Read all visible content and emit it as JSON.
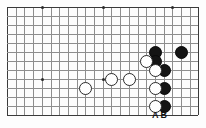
{
  "diagram": {
    "kind": "go-board-diagram",
    "board": {
      "columns": 23,
      "rows": 13,
      "origin_x": 7,
      "origin_y": 7,
      "step_x": 8.7,
      "step_y": 9.0,
      "line_color": "#8e8e8e",
      "edge_color": "#3a3a3a",
      "background": "#fdfdfd"
    },
    "hoshi": [
      {
        "col": 4,
        "row": 0
      },
      {
        "col": 11,
        "row": 0
      },
      {
        "col": 19,
        "row": 0
      },
      {
        "col": 4,
        "row": 8
      },
      {
        "col": 11,
        "row": 8
      }
    ],
    "stones": [
      {
        "color": "black",
        "col": 17,
        "row": 5
      },
      {
        "color": "black",
        "col": 20,
        "row": 5
      },
      {
        "color": "black",
        "col": 17,
        "row": 6
      },
      {
        "color": "black",
        "col": 18,
        "row": 7
      },
      {
        "color": "black",
        "col": 18,
        "row": 9
      },
      {
        "color": "black",
        "col": 18,
        "row": 11
      },
      {
        "color": "white",
        "col": 16,
        "row": 6
      },
      {
        "color": "white",
        "col": 17,
        "row": 7
      },
      {
        "color": "white",
        "col": 17,
        "row": 9
      },
      {
        "color": "white",
        "col": 17,
        "row": 11
      },
      {
        "color": "white",
        "col": 14,
        "row": 8
      },
      {
        "color": "white",
        "col": 12,
        "row": 8
      },
      {
        "color": "white",
        "col": 9,
        "row": 9
      }
    ],
    "point_labels": [
      {
        "text": "A",
        "col": 17,
        "row": 12
      },
      {
        "text": "B",
        "col": 18,
        "row": 12
      }
    ]
  }
}
